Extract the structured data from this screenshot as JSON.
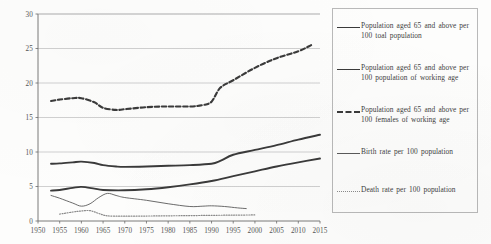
{
  "chart_data": {
    "type": "line",
    "title": "",
    "xlabel": "",
    "ylabel": "",
    "xlim": [
      1950,
      2015
    ],
    "ylim": [
      0,
      30
    ],
    "grid": true,
    "legend_position": "right",
    "x_ticks": [
      1950,
      1955,
      1960,
      1965,
      1970,
      1975,
      1980,
      1985,
      1990,
      1995,
      2000,
      2005,
      2010,
      2015
    ],
    "y_ticks": [
      0,
      5,
      10,
      15,
      20,
      25,
      30
    ],
    "series": [
      {
        "name": "Population aged 65 and above per 100 toal population",
        "style": "solid-thick",
        "x": [
          1953,
          1955,
          1958,
          1960,
          1963,
          1965,
          1968,
          1970,
          1975,
          1980,
          1985,
          1990,
          1992,
          1995,
          2000,
          2005,
          2010,
          2015
        ],
        "values": [
          8.3,
          8.35,
          8.5,
          8.6,
          8.4,
          8.1,
          7.9,
          7.85,
          7.9,
          8.0,
          8.1,
          8.3,
          8.7,
          9.6,
          10.3,
          11.0,
          11.8,
          12.5
        ]
      },
      {
        "name": "Population aged 65 and above per 100 population of working age",
        "style": "solid-thick",
        "x": [
          1953,
          1955,
          1958,
          1960,
          1963,
          1965,
          1970,
          1975,
          1980,
          1985,
          1990,
          1995,
          2000,
          2005,
          2010,
          2015
        ],
        "values": [
          4.4,
          4.5,
          4.8,
          4.95,
          4.7,
          4.5,
          4.45,
          4.6,
          4.9,
          5.3,
          5.8,
          6.5,
          7.2,
          7.9,
          8.5,
          9.05
        ]
      },
      {
        "name": "Population aged 65 and above per 100 females of working age",
        "style": "dashed",
        "x": [
          1953,
          1955,
          1958,
          1960,
          1963,
          1965,
          1968,
          1970,
          1975,
          1980,
          1985,
          1988,
          1990,
          1992,
          1995,
          2000,
          2005,
          2010,
          2013
        ],
        "values": [
          17.4,
          17.6,
          17.8,
          17.8,
          17.2,
          16.4,
          16.1,
          16.2,
          16.5,
          16.6,
          16.6,
          16.8,
          17.3,
          19.3,
          20.4,
          22.2,
          23.6,
          24.6,
          25.5
        ]
      },
      {
        "name": "Birth rate per 100 population",
        "style": "solid-thin",
        "x": [
          1953,
          1955,
          1958,
          1960,
          1962,
          1964,
          1966,
          1968,
          1970,
          1975,
          1980,
          1985,
          1988,
          1990,
          1993,
          1996,
          1998
        ],
        "values": [
          3.7,
          3.3,
          2.6,
          2.15,
          2.5,
          3.4,
          4.0,
          3.7,
          3.4,
          3.0,
          2.5,
          2.1,
          2.15,
          2.2,
          2.1,
          1.9,
          1.8
        ]
      },
      {
        "name": "Death rate per 100 population",
        "style": "dotted",
        "x": [
          1955,
          1958,
          1960,
          1962,
          1964,
          1966,
          1970,
          1975,
          1980,
          1985,
          1990,
          1995,
          2000
        ],
        "values": [
          1.0,
          1.3,
          1.45,
          1.5,
          1.1,
          0.75,
          0.7,
          0.72,
          0.75,
          0.78,
          0.82,
          0.85,
          0.88
        ]
      }
    ]
  },
  "legend": {
    "items": [
      {
        "label": "Population aged  65 and above per  100 toal population",
        "swatch": "line-solid-thick-icon"
      },
      {
        "label": "Population aged  65 and above per  100 population of working age",
        "swatch": "line-solid-thick-icon"
      },
      {
        "label": "Population aged  65 and above per  100 females of working age",
        "swatch": "line-dashed-icon"
      },
      {
        "label": "Birth rate per  100 population",
        "swatch": "line-solid-thin-icon"
      },
      {
        "label": "Death rate per  100 population",
        "swatch": "line-dotted-icon"
      }
    ]
  },
  "colors": {
    "line_dark": "#3a3a3a",
    "line_thin": "#5a5a5a",
    "line_dotted": "#8a8a8a",
    "grid": "#9a9a9a",
    "axis": "#6b6b6b",
    "text": "#4a4a4a",
    "legend_border": "#b9b9b9"
  }
}
